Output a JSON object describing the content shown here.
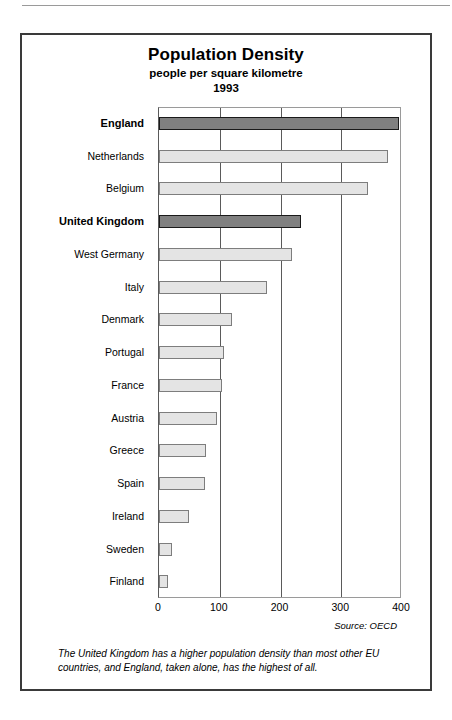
{
  "chart_data": {
    "type": "bar",
    "orientation": "horizontal",
    "title": "Population Density",
    "subtitle": "people per square kilometre",
    "year": "1993",
    "xlabel": "",
    "ylabel": "",
    "xlim": [
      0,
      400
    ],
    "xticks": [
      "0",
      "100",
      "200",
      "300",
      "400"
    ],
    "grid": true,
    "legend": null,
    "source": "Source: OECD",
    "caption": "The United Kingdom has a higher population density than most other EU countries, and England, taken alone, has the highest of all.",
    "colors": {
      "highlight_bar": "#808080",
      "normal_bar": "#e4e4e4",
      "bar_border": "#4a4a4a",
      "grid": "#5a5a5a",
      "frame": "#3a3a3a"
    },
    "categories": [
      "England",
      "Netherlands",
      "Belgium",
      "United Kingdom",
      "West Germany",
      "Italy",
      "Denmark",
      "Portugal",
      "France",
      "Austria",
      "Greece",
      "Spain",
      "Ireland",
      "Sweden",
      "Finland"
    ],
    "values": [
      395,
      377,
      344,
      234,
      219,
      177,
      120,
      107,
      104,
      95,
      78,
      76,
      50,
      21,
      15
    ],
    "highlighted": [
      "England",
      "United Kingdom"
    ],
    "bars": [
      {
        "label": "England",
        "value": 395,
        "highlight": true
      },
      {
        "label": "Netherlands",
        "value": 377,
        "highlight": false
      },
      {
        "label": "Belgium",
        "value": 344,
        "highlight": false
      },
      {
        "label": "United Kingdom",
        "value": 234,
        "highlight": true
      },
      {
        "label": "West Germany",
        "value": 219,
        "highlight": false
      },
      {
        "label": "Italy",
        "value": 177,
        "highlight": false
      },
      {
        "label": "Denmark",
        "value": 120,
        "highlight": false
      },
      {
        "label": "Portugal",
        "value": 107,
        "highlight": false
      },
      {
        "label": "France",
        "value": 104,
        "highlight": false
      },
      {
        "label": "Austria",
        "value": 95,
        "highlight": false
      },
      {
        "label": "Greece",
        "value": 78,
        "highlight": false
      },
      {
        "label": "Spain",
        "value": 76,
        "highlight": false
      },
      {
        "label": "Ireland",
        "value": 50,
        "highlight": false
      },
      {
        "label": "Sweden",
        "value": 21,
        "highlight": false
      },
      {
        "label": "Finland",
        "value": 15,
        "highlight": false
      }
    ]
  }
}
